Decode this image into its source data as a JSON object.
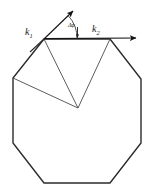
{
  "figure": {
    "background_color": "#ffffff",
    "stroke_color": "#2b2b2b",
    "stroke_color_light": "#4a4a4a",
    "labels": {
      "k1": "k",
      "k1_sub": "1",
      "k2": "k",
      "k2_sub": "2",
      "delta_phi": "Δφ"
    },
    "geometry": {
      "octagon_vertices": [
        [
          44,
          39
        ],
        [
          110,
          39
        ],
        [
          141,
          79
        ],
        [
          141,
          143
        ],
        [
          110,
          183
        ],
        [
          44,
          183
        ],
        [
          13,
          143
        ],
        [
          13,
          78
        ]
      ],
      "apex": [
        78,
        108
      ],
      "interior_lines": [
        [
          [
            44,
            39
          ],
          [
            78,
            108
          ]
        ],
        [
          [
            110,
            39
          ],
          [
            78,
            108
          ]
        ],
        [
          [
            13,
            78
          ],
          [
            78,
            108
          ]
        ]
      ],
      "k1_arrow": {
        "from": [
          30,
          52
        ],
        "through": [
          44,
          39
        ],
        "to": [
          75,
          9
        ]
      },
      "k2_arrow": {
        "from": [
          44,
          39
        ],
        "to": [
          141,
          38
        ]
      },
      "angle_arc": {
        "center": [
          44,
          39
        ],
        "radius": 33,
        "from_deg": -43,
        "to_deg": 0
      },
      "angle_tick": [
        78,
        26,
        78,
        36
      ]
    }
  }
}
